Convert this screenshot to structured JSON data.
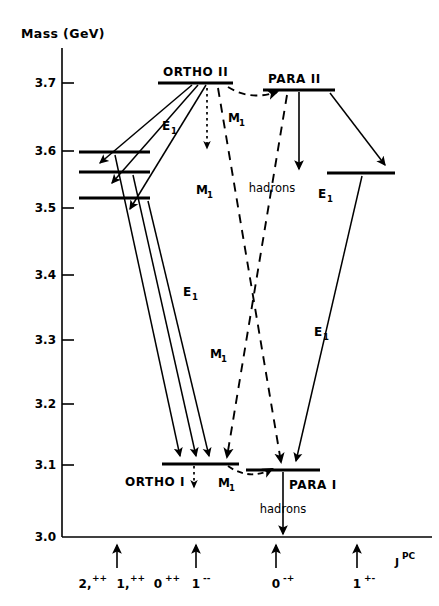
{
  "figure": {
    "yaxis_title": "Mass (GeV)",
    "xaxis_title_main": "J",
    "xaxis_title_sup": "PC",
    "y_ticks": [
      "3.7",
      "3.6",
      "3.5",
      "3.4",
      "3.3",
      "3.2",
      "3.1",
      "3.0"
    ],
    "jpc_groups": [
      {
        "items": [
          "2,++",
          "1,++",
          "0++"
        ]
      },
      {
        "items": [
          "1--"
        ]
      },
      {
        "items": [
          "0-+"
        ]
      },
      {
        "items": [
          "1+-"
        ]
      }
    ],
    "jpc_labels": [
      {
        "base": "2,",
        "sup": "++"
      },
      {
        "base": "1,",
        "sup": "++"
      },
      {
        "base": "0",
        "sup": "++"
      },
      {
        "base": "1",
        "sup": "--"
      },
      {
        "base": "0",
        "sup": "-+"
      },
      {
        "base": "1",
        "sup": "+-"
      }
    ],
    "states": [
      {
        "name": "ORTHO II",
        "mass": "3.7"
      },
      {
        "name": "PARA II",
        "mass": "3.69"
      },
      {
        "name": "ORTHO I",
        "mass": "3.1"
      },
      {
        "name": "PARA I",
        "mass": "3.09"
      }
    ],
    "state_labels": {
      "ortho_ii": "ORTHO II",
      "para_ii": "PARA II",
      "ortho_i": "ORTHO I",
      "para_i": "PARA I"
    },
    "transition_labels": {
      "e1": "E",
      "e1_sub": "1",
      "m1": "M",
      "m1_sub": "1"
    },
    "decay_labels": {
      "hadrons_top": "hadrons",
      "hadrons_bottom": "hadrons"
    },
    "e1_label_positions": [
      {
        "x": 167,
        "y": 130
      },
      {
        "x": 190,
        "y": 296
      },
      {
        "x": 319,
        "y": 198
      },
      {
        "x": 313,
        "y": 336
      }
    ],
    "m1_label_positions": [
      {
        "x": 226,
        "y": 122
      },
      {
        "x": 199,
        "y": 194
      },
      {
        "x": 215,
        "y": 358
      },
      {
        "x": 224,
        "y": 487
      }
    ],
    "colors": {
      "ink": "#000000",
      "background": "#ffffff"
    }
  }
}
